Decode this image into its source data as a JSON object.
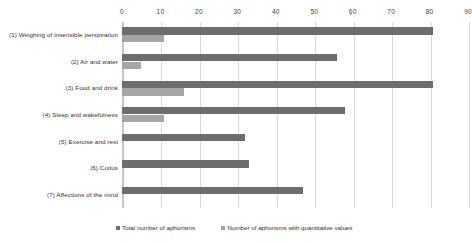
{
  "chart_data": {
    "type": "bar",
    "orientation": "horizontal",
    "title": "",
    "subtitle": "",
    "xlabel": "",
    "ylabel": "",
    "xlim": [
      0,
      90
    ],
    "xticks": [
      0,
      10,
      20,
      30,
      40,
      50,
      60,
      70,
      80,
      90
    ],
    "tick_labels": [
      "0",
      "10",
      "20",
      "30",
      "40",
      "50",
      "60",
      "70",
      "80",
      "90"
    ],
    "grid": true,
    "legend_position": "bottom",
    "categories": [
      "(1) Weighing of insensible perspiration",
      "(2) Air and water",
      "(3) Food and drink",
      "(4) Sleep and wakefulness",
      "(5) Exercise and rest",
      "(6) Coitus",
      "(7) Affections of the mind"
    ],
    "series": [
      {
        "name": "Total number of aphorisms",
        "color": "#6d6d6d",
        "values": [
          81,
          56,
          81,
          58,
          32,
          33,
          47
        ]
      },
      {
        "name": "Number of aphorisms with quantitative values",
        "color": "#a5a5a5",
        "values": [
          11,
          5,
          16,
          11,
          0,
          0,
          0
        ]
      }
    ]
  },
  "legend": {
    "items": [
      {
        "label": "Total number of aphorisms",
        "color": "#6d6d6d"
      },
      {
        "label": "Number of aphorisms with quantitative values",
        "color": "#a5a5a5"
      }
    ]
  },
  "colors": {
    "total_series": "#6d6d6d",
    "quant_series": "#a5a5a5",
    "gridline": "#d8d8d8",
    "axis": "#c2c2c2",
    "text": "#2f2f2f",
    "background": "#ffffff"
  }
}
